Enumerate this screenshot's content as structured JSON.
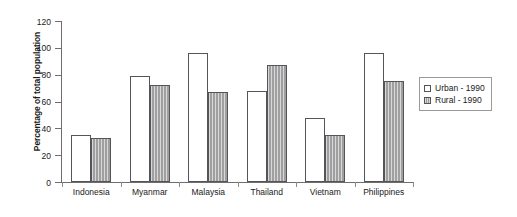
{
  "chart_data": {
    "type": "bar",
    "title": "",
    "xlabel": "",
    "ylabel": "Percentage of total population",
    "ylim": [
      0,
      120
    ],
    "yticks": [
      0,
      20,
      40,
      60,
      80,
      100,
      120
    ],
    "grid": false,
    "legend_position": "right",
    "categories": [
      "Indonesia",
      "Myanmar",
      "Malaysia",
      "Thailand",
      "Vietnam",
      "Philippines"
    ],
    "series": [
      {
        "name": "Urban - 1990",
        "color": "#ffffff",
        "values": [
          35,
          79,
          96,
          68,
          48,
          96
        ]
      },
      {
        "name": "Rural - 1990",
        "color": "#a9a9a9",
        "values": [
          33,
          72,
          67,
          87,
          35,
          75
        ]
      }
    ]
  },
  "legend": {
    "entries": [
      {
        "label": "Urban - 1990"
      },
      {
        "label": "Rural - 1990"
      }
    ]
  }
}
